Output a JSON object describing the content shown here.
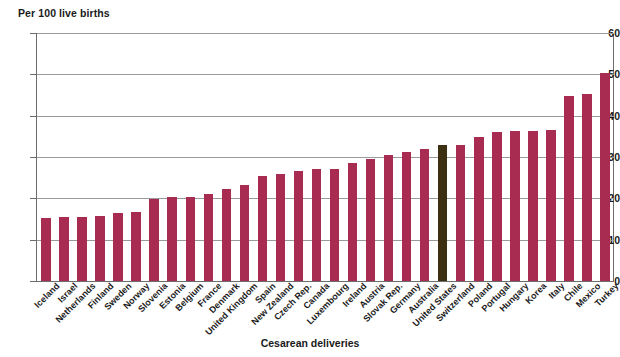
{
  "chart_data": {
    "type": "bar",
    "title": "",
    "ylabel": "Per 100 live births",
    "xlabel": "Cesarean deliveries",
    "ylim": [
      0,
      60
    ],
    "yticks": [
      0,
      10,
      20,
      30,
      40,
      50,
      60
    ],
    "grid": true,
    "legend": "none",
    "bar_color": "#a82b52",
    "highlight_color": "#3d2f12",
    "highlight_category": "United States",
    "categories": [
      "Iceland",
      "Israel",
      "Netherlands",
      "Finland",
      "Sweden",
      "Norway",
      "Slovenia",
      "Estonia",
      "Belgium",
      "France",
      "Denmark",
      "United Kingdom",
      "Spain",
      "New Zealand",
      "Czech Rep.",
      "Canada",
      "Luxembourg",
      "Ireland",
      "Austria",
      "Slovak Rep.",
      "Germany",
      "Australia",
      "United States",
      "Switzerland",
      "Poland",
      "Portugal",
      "Hungary",
      "Korea",
      "Italy",
      "Chile",
      "Mexico",
      "Turkey"
    ],
    "values": [
      15.2,
      15.5,
      15.6,
      15.8,
      16.4,
      16.6,
      19.8,
      20.3,
      20.4,
      21.0,
      22.3,
      23.2,
      25.3,
      25.9,
      26.5,
      27.1,
      27.1,
      28.5,
      29.4,
      30.5,
      31.1,
      31.9,
      32.8,
      33.0,
      34.8,
      36.0,
      36.2,
      36.3,
      36.6,
      44.8,
      45.3,
      50.4
    ],
    "series": [
      {
        "name": "Cesarean deliveries per 100 live births",
        "values": [
          15.2,
          15.5,
          15.6,
          15.8,
          16.4,
          16.6,
          19.8,
          20.3,
          20.4,
          21.0,
          22.3,
          23.2,
          25.3,
          25.9,
          26.5,
          27.1,
          27.1,
          28.5,
          29.4,
          30.5,
          31.1,
          31.9,
          32.8,
          33.0,
          34.8,
          36.0,
          36.2,
          36.3,
          36.6,
          44.8,
          45.3,
          50.4
        ]
      }
    ]
  }
}
